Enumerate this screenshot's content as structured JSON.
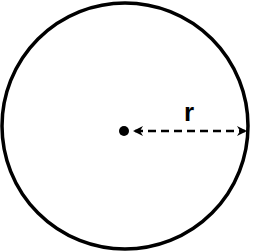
{
  "diagram": {
    "title": "",
    "shape": "circle",
    "radius_label": "r",
    "stroke_color": "#000000",
    "background_color": "#ffffff",
    "elements": [
      {
        "name": "circle",
        "cx": 125,
        "cy": 126,
        "r": 123
      },
      {
        "name": "center-point",
        "cx": 124,
        "cy": 131,
        "r": 5
      },
      {
        "name": "radius-arrow",
        "from": [
          133,
          131
        ],
        "to": [
          247,
          131
        ],
        "style": "dashed",
        "double_headed": true
      },
      {
        "name": "radius-label",
        "text": "r",
        "x": 190,
        "y": 120
      }
    ]
  }
}
